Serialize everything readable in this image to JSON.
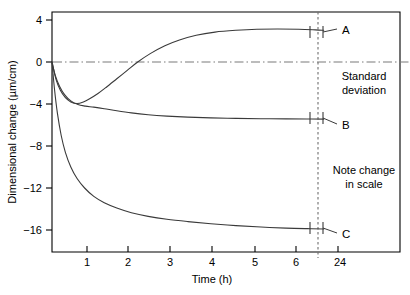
{
  "chart_data": {
    "type": "line",
    "title": "",
    "subtitle": "",
    "xlabel": "Time (h)",
    "ylabel": "Dimensional change (µm/cm)",
    "xlim": [
      0,
      7.5
    ],
    "ylim": [
      -18,
      5
    ],
    "grid": false,
    "legend_position": "inline-right",
    "x_ticks": [
      {
        "value": 1,
        "label": "1"
      },
      {
        "value": 2,
        "label": "2"
      },
      {
        "value": 3,
        "label": "3"
      },
      {
        "value": 4,
        "label": "4"
      },
      {
        "value": 5,
        "label": "5"
      },
      {
        "value": 6,
        "label": "6"
      },
      {
        "value": 24,
        "label": "24"
      }
    ],
    "y_ticks": [
      {
        "value": 4,
        "label": "4"
      },
      {
        "value": 0,
        "label": "0"
      },
      {
        "value": -4,
        "label": "−4"
      },
      {
        "value": -8,
        "label": "−8"
      },
      {
        "value": -12,
        "label": "−12"
      },
      {
        "value": -16,
        "label": "−16"
      }
    ],
    "axis_break": {
      "after_x": 6.5,
      "note": "Note change in scale"
    },
    "zero_reference_line": {
      "value": 0,
      "style": "dash-dot",
      "color": "#7b7b7b"
    },
    "series": [
      {
        "name": "A",
        "label": "A",
        "color": "#3a3a3a",
        "end_value": 3.1,
        "points": [
          [
            0.0,
            0.0
          ],
          [
            0.1,
            -1.7
          ],
          [
            0.2,
            -2.7
          ],
          [
            0.32,
            -3.4
          ],
          [
            0.45,
            -3.8
          ],
          [
            0.6,
            -3.95
          ],
          [
            0.75,
            -3.8
          ],
          [
            0.9,
            -3.5
          ],
          [
            1.1,
            -3.0
          ],
          [
            1.3,
            -2.4
          ],
          [
            1.55,
            -1.6
          ],
          [
            1.8,
            -0.8
          ],
          [
            2.05,
            0.0
          ],
          [
            2.35,
            0.8
          ],
          [
            2.7,
            1.55
          ],
          [
            3.05,
            2.1
          ],
          [
            3.45,
            2.55
          ],
          [
            3.9,
            2.85
          ],
          [
            4.4,
            3.02
          ],
          [
            4.9,
            3.12
          ],
          [
            5.4,
            3.14
          ],
          [
            5.9,
            3.12
          ],
          [
            6.3,
            3.06
          ],
          [
            6.5,
            3.02
          ]
        ]
      },
      {
        "name": "B",
        "label": "B",
        "color": "#3a3a3a",
        "end_value": -5.4,
        "points": [
          [
            0.0,
            0.0
          ],
          [
            0.08,
            -1.3
          ],
          [
            0.18,
            -2.3
          ],
          [
            0.3,
            -3.1
          ],
          [
            0.45,
            -3.7
          ],
          [
            0.62,
            -4.05
          ],
          [
            0.8,
            -4.2
          ],
          [
            1.0,
            -4.3
          ],
          [
            1.25,
            -4.45
          ],
          [
            1.55,
            -4.65
          ],
          [
            1.9,
            -4.85
          ],
          [
            2.3,
            -5.02
          ],
          [
            2.75,
            -5.15
          ],
          [
            3.25,
            -5.25
          ],
          [
            3.8,
            -5.32
          ],
          [
            4.4,
            -5.37
          ],
          [
            5.0,
            -5.4
          ],
          [
            5.6,
            -5.42
          ],
          [
            6.1,
            -5.43
          ],
          [
            6.5,
            -5.44
          ]
        ]
      },
      {
        "name": "C",
        "label": "C",
        "color": "#3a3a3a",
        "end_value": -15.9,
        "points": [
          [
            0.0,
            0.0
          ],
          [
            0.06,
            -2.6
          ],
          [
            0.13,
            -4.9
          ],
          [
            0.22,
            -7.0
          ],
          [
            0.32,
            -8.6
          ],
          [
            0.45,
            -10.0
          ],
          [
            0.6,
            -11.1
          ],
          [
            0.78,
            -12.0
          ],
          [
            1.0,
            -12.8
          ],
          [
            1.25,
            -13.4
          ],
          [
            1.55,
            -13.9
          ],
          [
            1.9,
            -14.35
          ],
          [
            2.3,
            -14.7
          ],
          [
            2.75,
            -14.98
          ],
          [
            3.25,
            -15.2
          ],
          [
            3.8,
            -15.4
          ],
          [
            4.4,
            -15.58
          ],
          [
            5.0,
            -15.72
          ],
          [
            5.6,
            -15.82
          ],
          [
            6.1,
            -15.87
          ],
          [
            6.5,
            -15.9
          ]
        ]
      }
    ],
    "annotations": [
      {
        "id": "standard-deviation",
        "line1": "Standard",
        "line2": "deviation"
      },
      {
        "id": "note-change-in-scale",
        "line1": "Note change",
        "line2": "in scale"
      }
    ],
    "error_bars": {
      "description": "Standard deviation caps at end of each curve",
      "series": [
        "A",
        "B",
        "C"
      ]
    }
  }
}
